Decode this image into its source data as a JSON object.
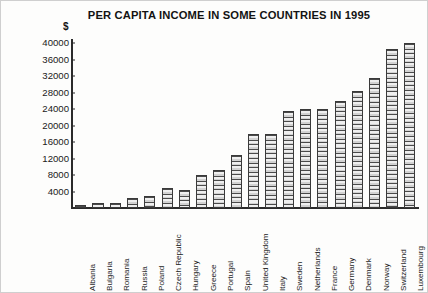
{
  "chart_data": {
    "type": "bar",
    "title": "PER CAPITA INCOME IN SOME COUNTRIES IN 1995",
    "xlabel": "",
    "ylabel": "$",
    "ylim": [
      0,
      41000
    ],
    "yticks": [
      4000,
      8000,
      12000,
      16000,
      20000,
      24000,
      28000,
      32000,
      36000,
      40000
    ],
    "ytick_labels": [
      "4000",
      "8000",
      "12000",
      "16000",
      "20000",
      "24000",
      "28000",
      "32000",
      "36000",
      "40000"
    ],
    "grid": false,
    "legend": "none",
    "categories": [
      "Albania",
      "Bulgaria",
      "Romania",
      "Russia",
      "Poland",
      "Czech Republic",
      "Hungary",
      "Greece",
      "Portugal",
      "Spain",
      "United Kingdom",
      "Italy",
      "Sweden",
      "Netherlands",
      "France",
      "Germany",
      "Denmark",
      "Norway",
      "Switzerland",
      "Luxembourg"
    ],
    "values": [
      800,
      1200,
      1300,
      2500,
      3000,
      4800,
      4300,
      8000,
      9200,
      12800,
      18000,
      18000,
      23500,
      24000,
      24000,
      26000,
      28500,
      31500,
      38500,
      40000
    ]
  }
}
